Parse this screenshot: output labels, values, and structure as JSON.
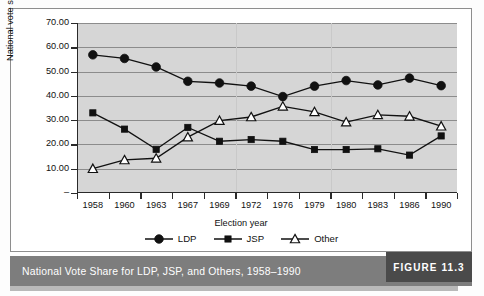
{
  "chart_data": {
    "type": "line",
    "title": "National Vote Share for LDP, JSP, and Others, 1958–1990",
    "xlabel": "Election year",
    "ylabel": "National vote share",
    "ylim": [
      0,
      70
    ],
    "ytick_labels": [
      "70.00",
      "60.00",
      "50.00",
      "40.00",
      "30.00",
      "20.00",
      "10.00",
      "–"
    ],
    "ytick_values": [
      70,
      60,
      50,
      40,
      30,
      20,
      10,
      0
    ],
    "grid": true,
    "legend_position": "bottom",
    "categories": [
      "1958",
      "1960",
      "1963",
      "1967",
      "1969",
      "1972",
      "1976",
      "1979",
      "1980",
      "1983",
      "1986",
      "1990"
    ],
    "series": [
      {
        "name": "LDP",
        "marker": "filled-circle",
        "color": "#111111",
        "values": [
          56.9,
          55.4,
          51.9,
          46.0,
          45.3,
          44.0,
          39.7,
          44.0,
          46.3,
          44.5,
          47.3,
          44.2
        ]
      },
      {
        "name": "JSP",
        "marker": "filled-square",
        "color": "#111111",
        "values": [
          33.0,
          26.3,
          18.0,
          27.0,
          21.3,
          22.0,
          21.3,
          17.9,
          17.9,
          18.2,
          15.6,
          23.5
        ]
      },
      {
        "name": "Other",
        "marker": "open-triangle",
        "color": "#111111",
        "values": [
          10.0,
          13.6,
          14.3,
          23.0,
          29.8,
          31.3,
          35.7,
          33.4,
          29.2,
          32.2,
          31.6,
          27.5
        ]
      }
    ]
  },
  "legend": {
    "items": [
      {
        "label": "LDP",
        "marker": "filled-circle"
      },
      {
        "label": "JSP",
        "marker": "filled-square"
      },
      {
        "label": "Other",
        "marker": "open-triangle"
      }
    ]
  },
  "caption": {
    "text": "National Vote Share for LDP, JSP, and Others, 1958–1990",
    "figure_tag": "FIGURE 11.3"
  },
  "colors": {
    "plot_background": "#d6d6d6",
    "gridline": "#8c8c8c",
    "axis": "#2a2a2a",
    "caption_bar": "#7d7d7d",
    "figure_tag_bg": "#4a4a4a",
    "ink": "#111111"
  }
}
